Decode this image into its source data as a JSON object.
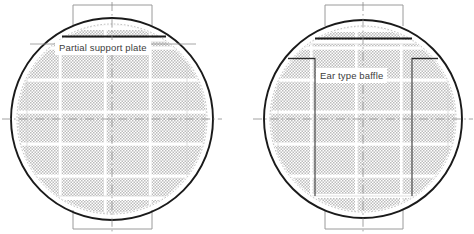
{
  "drawing": {
    "type": "engineering-section-drawing",
    "background_color": "#ffffff",
    "outline_color": "#1a1a1a",
    "thin_line_color": "#9a9a9a",
    "centerline_color": "#8c8c8c",
    "tube_fill_color": "#b8b8b8",
    "label_text_color": "#3c3c3c",
    "width": 474,
    "height": 234
  },
  "figures": [
    {
      "id": "partial-support-plate-figure",
      "name": "Partial support plate arrangement",
      "label": "Partial support plate",
      "shell": {
        "cx": 112,
        "cy": 119,
        "r": 101,
        "inner_r": 95
      },
      "nozzle_top": {
        "x1": 73,
        "x2": 152,
        "y": 5,
        "stem_bottom": 29
      },
      "nozzle_bottom": {
        "x1": 73,
        "x2": 152,
        "y": 229,
        "stem_top": 207
      },
      "support_plate": {
        "x1": 62,
        "x2": 165,
        "y": 37,
        "thickness": 2
      },
      "horizontal_bands": [
        48,
        80,
        112,
        144,
        176
      ],
      "vertical_gaps": [
        60,
        105,
        150
      ],
      "centerline_h": 119,
      "centerline_v": 112
    },
    {
      "id": "ear-type-baffle-figure",
      "name": "Ear type baffle arrangement",
      "label": "Ear type baffle",
      "shell": {
        "cx": 363,
        "cy": 119,
        "r": 99,
        "inner_r": 93
      },
      "nozzle_top": {
        "x1": 325,
        "x2": 403,
        "y": 5,
        "stem_bottom": 29
      },
      "nozzle_bottom": {
        "x1": 325,
        "x2": 403,
        "y": 229,
        "stem_top": 207
      },
      "top_plate": {
        "x1": 315,
        "x2": 412,
        "y": 39,
        "thickness": 2
      },
      "ear_baffle": {
        "left_shoulder_x1": 290,
        "left_shoulder_x2": 315,
        "right_shoulder_x1": 412,
        "right_shoulder_x2": 438,
        "shoulder_y": 58,
        "left_leg_x": 315,
        "right_leg_x": 412,
        "leg_bottom_y": 196
      },
      "horizontal_bands": [
        48,
        80,
        112,
        144,
        176
      ],
      "vertical_gaps": [
        311,
        356,
        401
      ],
      "centerline_h": 119,
      "centerline_v": 363
    }
  ],
  "legend": {
    "left_caption": "Partial support plate",
    "right_caption": "Ear type baffle"
  }
}
